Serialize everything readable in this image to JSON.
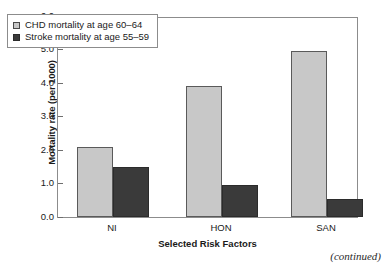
{
  "chart_data": {
    "type": "bar",
    "title": "",
    "xlabel": "Selected Risk Factors",
    "ylabel": "Mortality rate (per 1000)",
    "categories": [
      "NI",
      "HON",
      "SAN"
    ],
    "series": [
      {
        "name": "CHD mortality at age 60–64",
        "values": [
          2.1,
          3.9,
          4.95
        ],
        "color": "#c8c8c8"
      },
      {
        "name": "Stroke mortality at age 55–59",
        "values": [
          1.5,
          0.95,
          0.55
        ],
        "color": "#3a3a3a"
      }
    ],
    "ylim": [
      0.0,
      6.0
    ],
    "ytick_labels": [
      "0.0",
      "1.0",
      "2.0",
      "3.0",
      "4.0",
      "5.0",
      "6.0"
    ],
    "ytick_values": [
      0.0,
      1.0,
      2.0,
      3.0,
      4.0,
      5.0,
      6.0
    ],
    "grid": false,
    "legend_position": "upper-left-inside"
  },
  "footer": {
    "continued_note": "(continued)"
  }
}
